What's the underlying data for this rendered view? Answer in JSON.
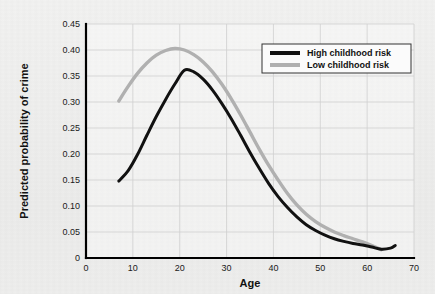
{
  "chart_data": {
    "type": "line",
    "title": "",
    "xlabel": "Age",
    "ylabel": "Predicted probability of crime",
    "xlim": [
      0,
      70
    ],
    "ylim": [
      0,
      0.45
    ],
    "grid": true,
    "legend_position": "top-right",
    "xticks": [
      "0",
      "10",
      "20",
      "30",
      "40",
      "50",
      "60",
      "70"
    ],
    "xtick_values": [
      0,
      10,
      20,
      30,
      40,
      50,
      60,
      70
    ],
    "yticks": [
      "0",
      "0.05",
      "0.10",
      "0.15",
      "0.20",
      "0.25",
      "0.30",
      "0.35",
      "0.40",
      "0.45"
    ],
    "ytick_values": [
      0,
      0.05,
      0.1,
      0.15,
      0.2,
      0.25,
      0.3,
      0.35,
      0.4,
      0.45
    ],
    "series": [
      {
        "name": "High childhood risk",
        "color": "#111111",
        "width": 3.0,
        "x": [
          7,
          9,
          11,
          13,
          15,
          17,
          19,
          21,
          23,
          25,
          27,
          29,
          31,
          33,
          35,
          37,
          39,
          41,
          43,
          45,
          47,
          49,
          51,
          53,
          55,
          57,
          59,
          61,
          63,
          65,
          66
        ],
        "values": [
          0.148,
          0.168,
          0.199,
          0.236,
          0.272,
          0.305,
          0.335,
          0.361,
          0.358,
          0.344,
          0.323,
          0.297,
          0.268,
          0.236,
          0.203,
          0.172,
          0.143,
          0.118,
          0.097,
          0.079,
          0.064,
          0.053,
          0.044,
          0.037,
          0.032,
          0.028,
          0.025,
          0.021,
          0.017,
          0.019,
          0.024
        ]
      },
      {
        "name": "Low childhood risk",
        "color": "#b0b0b0",
        "width": 3.4,
        "x": [
          7,
          9,
          11,
          13,
          15,
          17,
          19,
          21,
          23,
          25,
          27,
          29,
          31,
          33,
          35,
          37,
          39,
          41,
          43,
          45,
          47,
          49,
          51,
          53,
          55,
          57,
          59,
          61,
          63
        ],
        "values": [
          0.302,
          0.33,
          0.355,
          0.375,
          0.39,
          0.399,
          0.403,
          0.4,
          0.391,
          0.377,
          0.358,
          0.334,
          0.306,
          0.275,
          0.242,
          0.209,
          0.178,
          0.15,
          0.124,
          0.102,
          0.084,
          0.07,
          0.059,
          0.05,
          0.043,
          0.037,
          0.031,
          0.024,
          0.016
        ]
      }
    ]
  },
  "legend": {
    "entries": [
      {
        "label": "High childhood risk"
      },
      {
        "label": "Low childhood risk"
      }
    ]
  }
}
